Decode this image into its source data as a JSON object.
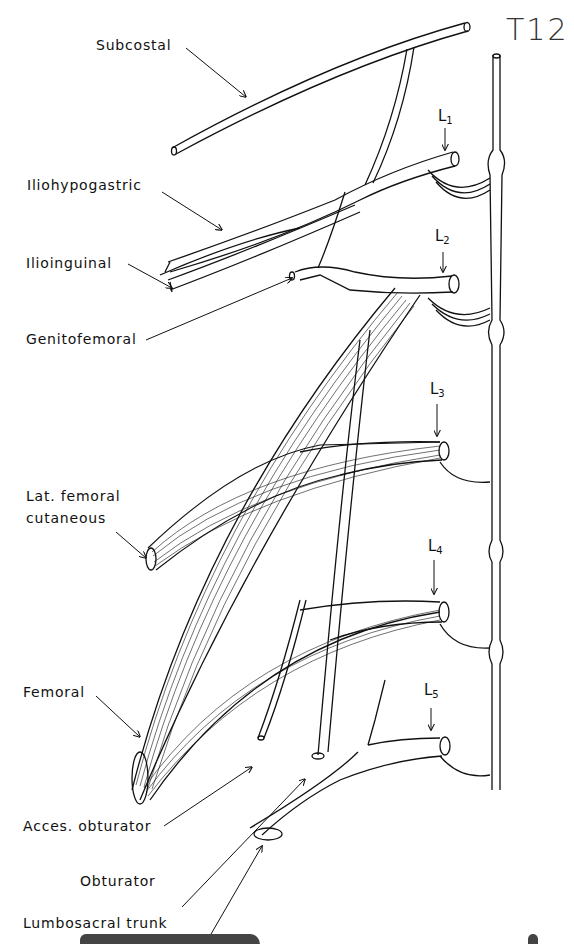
{
  "title_annotation": "T12",
  "segments": [
    {
      "letter": "L",
      "sub": "1"
    },
    {
      "letter": "L",
      "sub": "2"
    },
    {
      "letter": "L",
      "sub": "3"
    },
    {
      "letter": "L",
      "sub": "4"
    },
    {
      "letter": "L",
      "sub": "5"
    }
  ],
  "labels": {
    "subcostal": "Subcostal",
    "iliohypogastric": "Iliohypogastric",
    "ilioinguinal": "Ilioinguinal",
    "genitofemoral": "Genitofemoral",
    "lat_femoral_1": "Lat. femoral",
    "lat_femoral_2": "cutaneous",
    "femoral": "Femoral",
    "acces_obturator": "Acces. obturator",
    "obturator": "Obturator",
    "lumbosacral_trunk": "Lumbosacral trunk"
  },
  "colors": {
    "line": "#111111",
    "background": "#ffffff"
  }
}
